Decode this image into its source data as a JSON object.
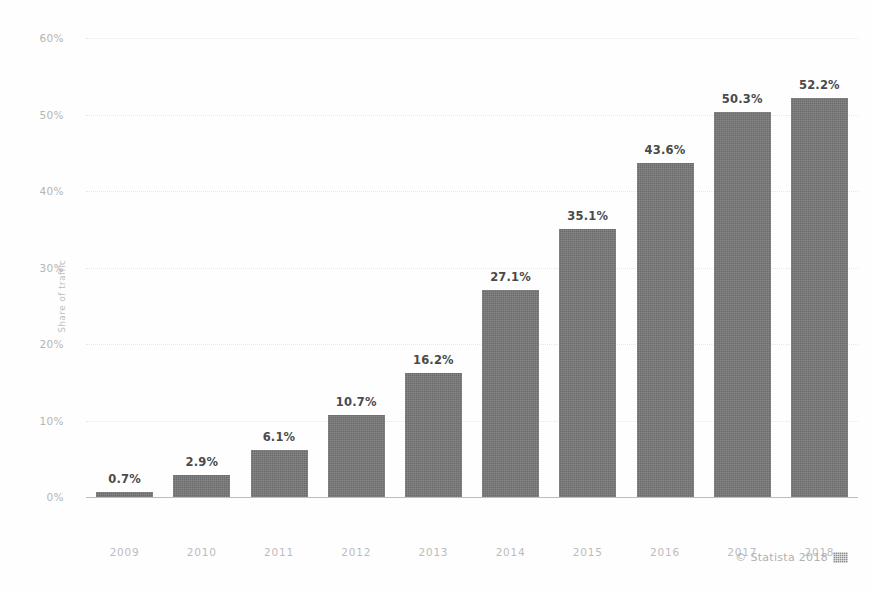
{
  "chart_data": {
    "type": "bar",
    "title": "",
    "subtitle": "",
    "xlabel": "",
    "ylabel": "Share of traffic",
    "categories": [
      "2009",
      "2010",
      "2011",
      "2012",
      "2013",
      "2014",
      "2015",
      "2016",
      "2017",
      "2018"
    ],
    "values": [
      0.7,
      2.9,
      6.1,
      10.7,
      16.2,
      27.1,
      35.1,
      43.6,
      50.3,
      52.2
    ],
    "value_labels": [
      "0.7%",
      "2.9%",
      "6.1%",
      "10.7%",
      "16.2%",
      "27.1%",
      "35.1%",
      "43.6%",
      "50.3%",
      "52.2%"
    ],
    "ylim": [
      0,
      60
    ],
    "yticks": [
      0,
      10,
      20,
      30,
      40,
      50,
      60
    ],
    "ytick_labels": [
      "0%",
      "10%",
      "20%",
      "30%",
      "40%",
      "50%",
      "60%"
    ],
    "grid": true,
    "legend": "none",
    "bar_color": "#6b6b6b",
    "label_color": "#4a4a4a",
    "axis_text_color": "#bcbcbc",
    "gridline_color": "#e2e2e2",
    "background_color": "#fefefe"
  },
  "footer": {
    "copyright": "© Statista 2018",
    "logo_icon": "statista-flag-icon"
  }
}
